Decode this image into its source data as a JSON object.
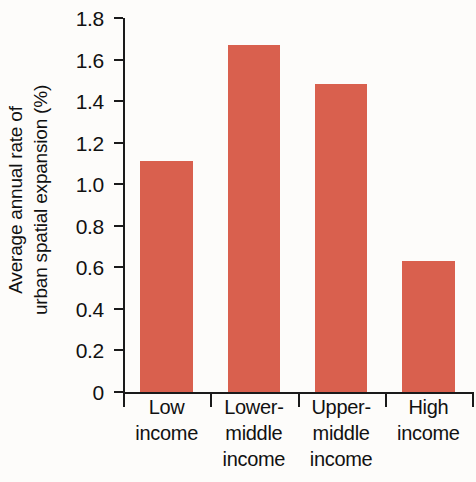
{
  "chart_data": {
    "type": "bar",
    "title": "",
    "xlabel": "",
    "ylabel": "Average annual rate of urban spatial expansion (%)",
    "ylabel_lines": [
      "Average annual rate of",
      "urban spatial expansion (%)"
    ],
    "categories": [
      "Low income",
      "Lower-middle income",
      "Upper-middle income",
      "High income"
    ],
    "category_lines": [
      [
        "Low",
        "income"
      ],
      [
        "Lower-",
        "middle",
        "income"
      ],
      [
        "Upper-",
        "middle",
        "income"
      ],
      [
        "High",
        "income"
      ]
    ],
    "values": [
      1.11,
      1.67,
      1.48,
      0.63
    ],
    "ylim": [
      0,
      1.8
    ],
    "ytick_labels": [
      "1.8",
      "1.6",
      "1.4",
      "1.2",
      "1.0",
      "0.8",
      "0.6",
      "0.4",
      "0.2",
      "0"
    ],
    "ytick_values": [
      1.8,
      1.6,
      1.4,
      1.2,
      1.0,
      0.8,
      0.6,
      0.4,
      0.2,
      0
    ],
    "grid": false,
    "legend": "none",
    "bar_color": "#d9604e",
    "axis_color": "#1a1a1a",
    "background_color": "#fdfcfa"
  }
}
